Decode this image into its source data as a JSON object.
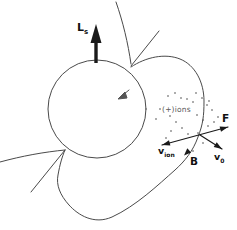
{
  "colors": {
    "background": "#ffffff",
    "field_line": "#4a4a4a",
    "ink": "#1a1a1a",
    "ions_text": "#5a5a5a"
  },
  "sphere": {
    "cx": 97,
    "cy": 109,
    "r": 49
  },
  "spin_arrow": {
    "shaft_d": "M96,63 L96,40",
    "head_d": "M96,24 L90.5,43 L101.5,43 Z",
    "label": "L",
    "label_sub": "s",
    "label_x": 77,
    "label_y": 31
  },
  "field_lines": {
    "loop_d": "M131,67 C146,57 165,53 180,59 C195,65 204,82 204,101 C204,116 203,124 198,137 C193,151 185,161 175,170 C158,185 136,206 112,217 C94,225 78,215 69,205 C60,195 56,185 58,175 C60,164 62,157 65,150",
    "top_curve_d": "M116,2 C123,22 128,43 131,64",
    "top_line_d": "M131,66 L159,31",
    "left_curve_d": "M0,162 C22,156 44,152 65,150",
    "left_line_d": "M65,150 L31,192",
    "b_arrowhead_d": "M184,155.5 L187.3,148.2 L191.1,152.4 Z"
  },
  "vectors": {
    "f_vion_line_d": "M162,145 L228,127",
    "f_head_d": "M228,127 L221,131.8 L219.6,126.4 Z",
    "vion_head_d": "M162,145 L169,140.2 L170.4,145.6 Z",
    "v0_line_d": "M200,135 L222,149",
    "v0_head_d": "M222,149 L213.7,147.1 L216.7,142.3 Z"
  },
  "dart_glyph": {
    "line_d": "M129,90 L123,95",
    "head_d": "M118,99 L125,92 L127,98 Z"
  },
  "labels": {
    "f": {
      "text": "F",
      "x": 222,
      "y": 122
    },
    "v_ion": {
      "main": "v",
      "sub": "ion",
      "x": 158,
      "y": 154
    },
    "v0": {
      "main": "v",
      "sub": "0",
      "x": 214,
      "y": 160
    },
    "b": {
      "text": "B",
      "x": 190,
      "y": 165
    },
    "ions": {
      "text": "(+)ions",
      "x": 162,
      "y": 112
    }
  },
  "ions_region": {
    "dot_radius": 0.8,
    "dots": [
      [
        168,
        96
      ],
      [
        175,
        93
      ],
      [
        181,
        98
      ],
      [
        187,
        99
      ],
      [
        193,
        102
      ],
      [
        196,
        93
      ],
      [
        202,
        98
      ],
      [
        207,
        105
      ],
      [
        212,
        110
      ],
      [
        209,
        101
      ],
      [
        160,
        109
      ],
      [
        156,
        119
      ],
      [
        170,
        116
      ],
      [
        176,
        122
      ],
      [
        182,
        128
      ],
      [
        188,
        134
      ],
      [
        171,
        131
      ],
      [
        197,
        115
      ],
      [
        203,
        120
      ],
      [
        208,
        126
      ],
      [
        214,
        122
      ],
      [
        218,
        117
      ],
      [
        198,
        133
      ],
      [
        203,
        143
      ],
      [
        193,
        151
      ],
      [
        166,
        138
      ]
    ]
  }
}
